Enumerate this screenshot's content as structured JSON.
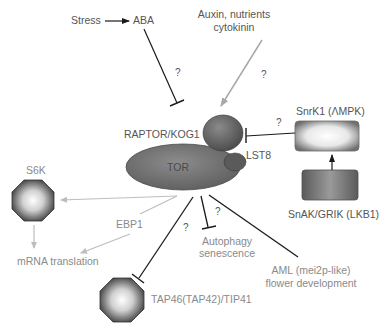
{
  "diagram": {
    "type": "signaling-pathway",
    "colors": {
      "background": "#ffffff",
      "inhibition_line": "#1a1a1a",
      "activation_grey": "#aaaaaa",
      "node_dark": "#6e6e6e",
      "label_dark": "#555555",
      "label_grey": "#8a8a8a"
    },
    "nodes": {
      "stress": "Stress",
      "aba": "ABA",
      "auxin_line1": "Auxin, nutrients",
      "auxin_line2": "cytokinin",
      "raptor": "RAPTOR/KOG1",
      "tor": "TOR",
      "lst8": "LST8",
      "snrk1": "SnrK1 (ΛMPK)",
      "snak": "SnAK/GRIK (LKB1)",
      "s6k": "S6K",
      "ebp1": "EBP1",
      "mrna": "mRNA translation",
      "autophagy_line1": "Autophagy",
      "autophagy_line2": "senescence",
      "aml_line1": "AML (mei2p-like)",
      "aml_line2": "flower development",
      "tap46": "TAP46(TAP42)/TIP41"
    },
    "question_marks": {
      "aba_tor": "?",
      "auxin_tor": "?",
      "snrk1_raptor": "?",
      "tor_tap46": "?",
      "tor_autophagy": "?"
    },
    "edges": [
      {
        "from": "Stress",
        "to": "ABA",
        "type": "activation"
      },
      {
        "from": "ABA",
        "to": "TOR complex",
        "type": "inhibition",
        "uncertain": true
      },
      {
        "from": "Auxin, nutrients, cytokinin",
        "to": "TOR complex",
        "type": "activation",
        "uncertain": true
      },
      {
        "from": "SnrK1",
        "to": "RAPTOR/KOG1",
        "type": "inhibition",
        "uncertain": true
      },
      {
        "from": "SnAK/GRIK",
        "to": "SnrK1",
        "type": "activation"
      },
      {
        "from": "TOR",
        "to": "S6K",
        "type": "activation"
      },
      {
        "from": "TOR",
        "to": "EBP1 / mRNA translation",
        "type": "activation"
      },
      {
        "from": "S6K",
        "to": "mRNA translation",
        "type": "activation"
      },
      {
        "from": "TOR",
        "to": "TAP46(TAP42)/TIP41",
        "type": "inhibition",
        "uncertain": true
      },
      {
        "from": "TOR",
        "to": "Autophagy senescence",
        "type": "inhibition",
        "uncertain": true
      },
      {
        "from": "TOR",
        "to": "AML (mei2p-like) flower development",
        "type": "activation"
      }
    ]
  }
}
